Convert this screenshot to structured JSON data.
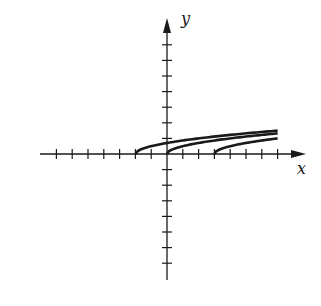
{
  "chart_data": {
    "type": "line",
    "title": "",
    "xlabel": "x",
    "ylabel": "y",
    "xlim": [
      -7,
      7
    ],
    "ylim": [
      -7,
      7
    ],
    "grid": false,
    "legend": null,
    "x_ticks": [
      -7,
      -6,
      -5,
      -4,
      -3,
      -2,
      -1,
      1,
      2,
      3,
      4,
      5,
      6,
      7
    ],
    "y_ticks": [
      -7,
      -6,
      -5,
      -4,
      -3,
      -2,
      -1,
      1,
      2,
      3,
      4,
      5,
      6,
      7
    ],
    "tick_labels_shown": false,
    "series": [
      {
        "name": "y = (1/2)sqrt(x+2)",
        "x_start": -2,
        "x_end": 7,
        "x": [
          -2,
          -1,
          0,
          1,
          2,
          3,
          4,
          5,
          6,
          7
        ],
        "y": [
          0,
          0.5,
          0.71,
          0.87,
          1.0,
          1.12,
          1.22,
          1.32,
          1.41,
          1.5
        ]
      },
      {
        "name": "y = (1/2)sqrt(x)",
        "x_start": 0,
        "x_end": 7,
        "x": [
          0,
          1,
          2,
          3,
          4,
          5,
          6,
          7
        ],
        "y": [
          0,
          0.5,
          0.71,
          0.87,
          1.0,
          1.12,
          1.22,
          1.32
        ]
      },
      {
        "name": "y = (1/2)sqrt(x-3)",
        "x_start": 3,
        "x_end": 7,
        "x": [
          3,
          4,
          5,
          6,
          7
        ],
        "y": [
          0,
          0.5,
          0.71,
          0.87,
          1.0
        ]
      }
    ]
  },
  "axes": {
    "x_label": "x",
    "y_label": "y"
  },
  "colors": {
    "ink": "#1a1a1a",
    "background": "#ffffff"
  }
}
